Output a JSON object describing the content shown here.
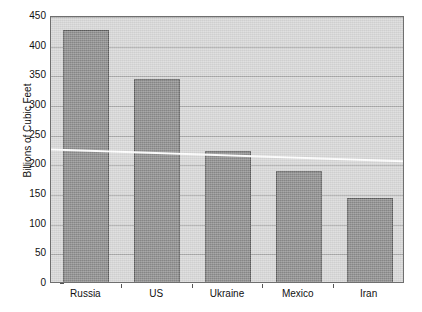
{
  "chart_data": {
    "type": "bar",
    "title": "",
    "xlabel": "",
    "ylabel": "Billions of Cubic Feet",
    "categories": [
      "Russia",
      "US",
      "Ukraine",
      "Mexico",
      "Iran"
    ],
    "values": [
      428,
      346,
      224,
      191,
      145
    ],
    "series": [
      {
        "name": "Natural gas",
        "values": [
          428,
          346,
          224,
          191,
          145
        ]
      }
    ],
    "ylim": [
      0,
      450
    ],
    "yticks": [
      0,
      50,
      100,
      150,
      200,
      250,
      300,
      350,
      400,
      450
    ],
    "ytick_labels": [
      "0",
      "50",
      "100",
      "150",
      "200",
      "250",
      "300",
      "350",
      "400",
      "450"
    ],
    "grid": true,
    "legend": "none",
    "trendline": {
      "name": "trend",
      "color": "#ffffff",
      "start_value": 225,
      "end_value": 205
    },
    "colors": {
      "bar_fill": "#8b8b8b",
      "bar_edge": "#5d5d5d",
      "plot_background": "#d6d6d6",
      "gridline": "#a8a8a8",
      "axis": "#6f6f6f",
      "text": "#111111",
      "trendline": "#ffffff"
    }
  }
}
